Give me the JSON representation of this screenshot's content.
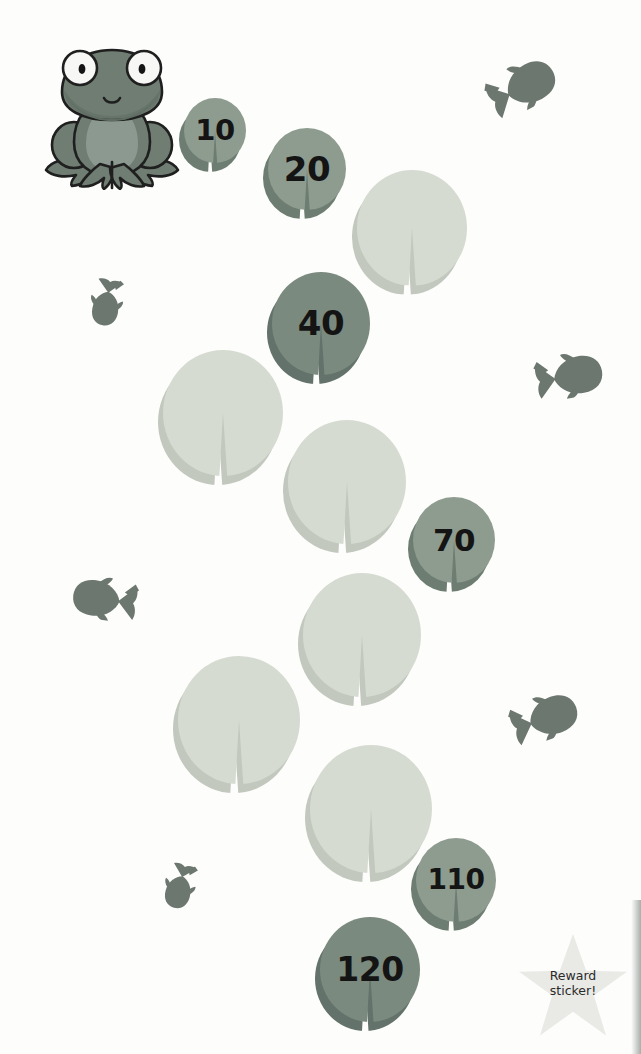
{
  "worksheet": {
    "theme": "frog-lily-pad-counting-in-tens",
    "background_color": "#fdfdfc"
  },
  "frog": {
    "name": "frog-character",
    "x": 42,
    "y": 42,
    "width": 140,
    "height": 148,
    "body_color": "#6f7d73",
    "belly_color": "#8b9990",
    "outline_color": "#1f1f1f",
    "eye_white": "#f7f7f5",
    "pupil_color": "#141414"
  },
  "pads": [
    {
      "id": "pad-10",
      "label": "10",
      "state": "filled",
      "x": 184,
      "y": 98,
      "size": 62,
      "font_size": 29
    },
    {
      "id": "pad-20",
      "label": "20",
      "state": "filled",
      "x": 268,
      "y": 128,
      "size": 78,
      "font_size": 34
    },
    {
      "id": "pad-30",
      "label": "",
      "state": "blank",
      "x": 357,
      "y": 170,
      "size": 110,
      "font_size": 0
    },
    {
      "id": "pad-40",
      "label": "40",
      "state": "dark",
      "x": 272,
      "y": 272,
      "size": 98,
      "font_size": 34
    },
    {
      "id": "pad-50",
      "label": "",
      "state": "blank",
      "x": 163,
      "y": 350,
      "size": 120,
      "font_size": 0
    },
    {
      "id": "pad-60",
      "label": "",
      "state": "blank",
      "x": 288,
      "y": 420,
      "size": 118,
      "font_size": 0
    },
    {
      "id": "pad-70",
      "label": "70",
      "state": "filled",
      "x": 413,
      "y": 497,
      "size": 82,
      "font_size": 31
    },
    {
      "id": "pad-80",
      "label": "",
      "state": "blank",
      "x": 303,
      "y": 573,
      "size": 118,
      "font_size": 0
    },
    {
      "id": "pad-90",
      "label": "",
      "state": "blank",
      "x": 178,
      "y": 656,
      "size": 122,
      "font_size": 0
    },
    {
      "id": "pad-100",
      "label": "",
      "state": "blank",
      "x": 310,
      "y": 745,
      "size": 122,
      "font_size": 0
    },
    {
      "id": "pad-110",
      "label": "110",
      "state": "filled",
      "x": 416,
      "y": 838,
      "size": 80,
      "font_size": 28
    },
    {
      "id": "pad-120",
      "label": "120",
      "state": "dark",
      "x": 320,
      "y": 917,
      "size": 100,
      "font_size": 33
    }
  ],
  "fish": [
    {
      "id": "fish-top-right",
      "x": 484,
      "y": 58,
      "width": 74,
      "height": 52,
      "rotation": -28,
      "flip": false
    },
    {
      "id": "fish-left-upper",
      "x": 84,
      "y": 268,
      "width": 50,
      "height": 70,
      "rotation": 100,
      "flip": false
    },
    {
      "id": "fish-right-middle",
      "x": 531,
      "y": 348,
      "width": 76,
      "height": 50,
      "rotation": -10,
      "flip": false
    },
    {
      "id": "fish-left-middle",
      "x": 70,
      "y": 572,
      "width": 70,
      "height": 48,
      "rotation": 8,
      "flip": true
    },
    {
      "id": "fish-right-lower",
      "x": 508,
      "y": 690,
      "width": 72,
      "height": 50,
      "rotation": -20,
      "flip": false
    },
    {
      "id": "fish-left-bottom",
      "x": 158,
      "y": 852,
      "width": 48,
      "height": 70,
      "rotation": 105,
      "flip": false
    }
  ],
  "fish_style": {
    "color": "#6c776f"
  },
  "reward_sticker": {
    "name": "reward-sticker-star",
    "line1": "Reward",
    "line2": "sticker!",
    "x": 518,
    "y": 934,
    "star_color": "#e9e9e6",
    "text_color": "#2b2b2b"
  },
  "chart_data": {
    "type": "table",
    "categories": [
      "10",
      "20",
      "30",
      "40",
      "50",
      "60",
      "70",
      "80",
      "90",
      "100",
      "110",
      "120"
    ],
    "values": [
      10,
      20,
      null,
      40,
      null,
      null,
      70,
      null,
      null,
      null,
      110,
      120
    ],
    "filled_labels": [
      "10",
      "20",
      "40",
      "70",
      "110",
      "120"
    ],
    "blank_count": 6,
    "step": 10,
    "xlabel": "",
    "ylabel": ""
  }
}
